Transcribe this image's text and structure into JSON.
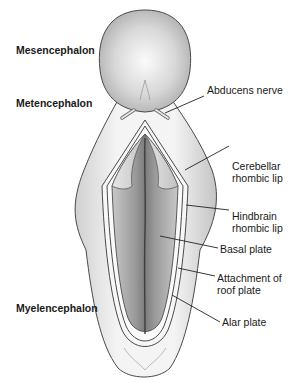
{
  "figure": {
    "type": "anatomical-diagram"
  },
  "region_labels": [
    {
      "id": "mesencephalon",
      "text": "Mesencephalon"
    },
    {
      "id": "metencephalon",
      "text": "Metencephalon"
    },
    {
      "id": "myelencephalon",
      "text": "Myelencephalon"
    }
  ],
  "structure_labels": [
    {
      "id": "abducens",
      "line1": "Abducens nerve",
      "line2": ""
    },
    {
      "id": "cerebellar",
      "line1": "Cerebellar",
      "line2": "rhombic lip"
    },
    {
      "id": "hindbrain",
      "line1": "Hindbrain",
      "line2": "rhombic lip"
    },
    {
      "id": "basal",
      "line1": "Basal plate",
      "line2": ""
    },
    {
      "id": "attachment",
      "line1": "Attachment of",
      "line2": "roof plate"
    },
    {
      "id": "alar",
      "line1": "Alar plate",
      "line2": ""
    }
  ],
  "colors": {
    "outline": "#4a4a4a",
    "fill_light": "#efefef",
    "fill_mid": "#c9c9c9",
    "fill_dark": "#8f8f8f",
    "leader_line": "#222222"
  }
}
